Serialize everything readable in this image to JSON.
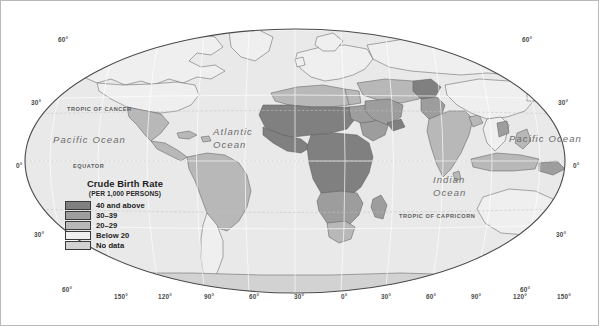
{
  "figure": {
    "kind": "world-choropleth-map",
    "projection": "robinson",
    "background_color": "#ffffff",
    "frame_color": "#b9b9b9",
    "ocean_color": "#e9e9e9",
    "graticule_color": "#ffffff",
    "coastline_color": "#5a5a5a",
    "border_color": "#3c3c3c"
  },
  "legend": {
    "title": "Crude Birth Rate",
    "subtitle": "(PER 1,000 PERSONS)",
    "classes": [
      {
        "label": "40 and above",
        "color": "#808080"
      },
      {
        "label": "30–39",
        "color": "#9e9e9e"
      },
      {
        "label": "20–29",
        "color": "#b8b8b8"
      },
      {
        "label": "Below 20",
        "color": "#efefef"
      },
      {
        "label": "No data",
        "color": "#d2d2d2"
      }
    ]
  },
  "ocean_labels": [
    {
      "name": "Pacific Ocean",
      "lines": [
        "Pacific Ocean"
      ],
      "x": 52,
      "y": 133
    },
    {
      "name": "Atlantic Ocean",
      "lines": [
        "Atlantic",
        "Ocean"
      ],
      "x": 212,
      "y": 124
    },
    {
      "name": "Indian Ocean",
      "lines": [
        "Indian",
        "Ocean"
      ],
      "x": 432,
      "y": 172
    },
    {
      "name": "Pacific Ocean",
      "lines": [
        "Pacific Ocean"
      ],
      "x": 508,
      "y": 132
    }
  ],
  "reference_lines": [
    {
      "name": "TROPIC OF CANCER",
      "x": 66,
      "y": 105
    },
    {
      "name": "EQUATOR",
      "x": 72,
      "y": 162
    },
    {
      "name": "TROPIC OF CAPRICORN",
      "x": 398,
      "y": 212
    }
  ],
  "graticule_labels": {
    "latitude_left": [
      {
        "text": "60°",
        "x": 57,
        "y": 35
      },
      {
        "text": "30°",
        "x": 30,
        "y": 98
      },
      {
        "text": "0°",
        "x": 15,
        "y": 161
      },
      {
        "text": "30°",
        "x": 33,
        "y": 230
      },
      {
        "text": "60°",
        "x": 61,
        "y": 285
      }
    ],
    "latitude_right": [
      {
        "text": "60°",
        "x": 521,
        "y": 35
      },
      {
        "text": "30°",
        "x": 557,
        "y": 98
      },
      {
        "text": "0°",
        "x": 572,
        "y": 161
      },
      {
        "text": "30°",
        "x": 555,
        "y": 230
      },
      {
        "text": "60°",
        "x": 519,
        "y": 285
      }
    ],
    "longitude_bottom": [
      {
        "text": "150°",
        "x": 113,
        "y": 292
      },
      {
        "text": "120°",
        "x": 157,
        "y": 292
      },
      {
        "text": "90°",
        "x": 203,
        "y": 292
      },
      {
        "text": "60°",
        "x": 248,
        "y": 292
      },
      {
        "text": "30°",
        "x": 293,
        "y": 292
      },
      {
        "text": "0°",
        "x": 340,
        "y": 292
      },
      {
        "text": "30°",
        "x": 380,
        "y": 292
      },
      {
        "text": "60°",
        "x": 425,
        "y": 292
      },
      {
        "text": "90°",
        "x": 470,
        "y": 292
      },
      {
        "text": "120°",
        "x": 512,
        "y": 292
      },
      {
        "text": "150°",
        "x": 556,
        "y": 292
      }
    ]
  },
  "chart_data": {
    "type": "map",
    "title": "Crude Birth Rate",
    "subtitle": "(PER 1,000 PERSONS)",
    "units": "births per 1,000 persons",
    "classes": [
      "40 and above",
      "30–39",
      "20–29",
      "Below 20",
      "No data"
    ],
    "regions": [
      {
        "region": "Sub-Saharan Africa (Sahel, West, Central, East)",
        "class": "40 and above"
      },
      {
        "region": "Afghanistan",
        "class": "40 and above"
      },
      {
        "region": "Yemen",
        "class": "40 and above"
      },
      {
        "region": "Southern Africa (Angola, Zambia, Mozambique, Madagascar)",
        "class": "30–39"
      },
      {
        "region": "Pakistan",
        "class": "30–39"
      },
      {
        "region": "Sudan / Ethiopia / Somalia",
        "class": "30–39"
      },
      {
        "region": "Saudi Arabia and Gulf states",
        "class": "30–39"
      },
      {
        "region": "Laos / Cambodia",
        "class": "30–39"
      },
      {
        "region": "Papua New Guinea",
        "class": "30–39"
      },
      {
        "region": "Mexico and Central America",
        "class": "20–29"
      },
      {
        "region": "Northern South America (Colombia, Venezuela, Peru, Bolivia, Brazil)",
        "class": "20–29"
      },
      {
        "region": "India / Bangladesh / Nepal",
        "class": "20–29"
      },
      {
        "region": "Indonesia / Philippines / Malaysia",
        "class": "20–29"
      },
      {
        "region": "North Africa (Morocco, Algeria, Egypt, Libya)",
        "class": "20–29"
      },
      {
        "region": "South Africa / Namibia / Botswana",
        "class": "20–29"
      },
      {
        "region": "Turkey / Iran / Iraq",
        "class": "20–29"
      },
      {
        "region": "United States and Canada",
        "class": "Below 20"
      },
      {
        "region": "Greenland",
        "class": "Below 20"
      },
      {
        "region": "Europe (all)",
        "class": "Below 20"
      },
      {
        "region": "Russia",
        "class": "Below 20"
      },
      {
        "region": "China",
        "class": "Below 20"
      },
      {
        "region": "Japan / Korea",
        "class": "Below 20"
      },
      {
        "region": "Australia and New Zealand",
        "class": "Below 20"
      },
      {
        "region": "Argentina / Chile / Uruguay",
        "class": "Below 20"
      },
      {
        "region": "Thailand / Vietnam",
        "class": "Below 20"
      },
      {
        "region": "Antarctica",
        "class": "No data"
      }
    ],
    "graticule_interval_deg": 30,
    "xlabel": "",
    "ylabel": ""
  }
}
